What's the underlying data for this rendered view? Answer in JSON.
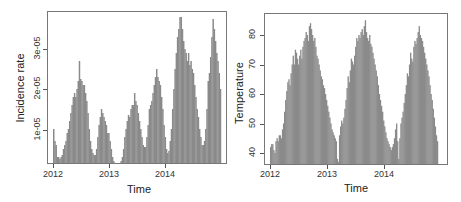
{
  "chart_data": [
    {
      "type": "bar",
      "title": "",
      "xlabel": "Time",
      "ylabel": "Incidence rate",
      "x_ticks": [
        "2012",
        "2013",
        "2014"
      ],
      "y_ticks": [
        "1e-05",
        "2e-05",
        "3e-05"
      ],
      "y_tick_values": [
        1e-05,
        2e-05,
        3e-05
      ],
      "xlim": [
        2012.0,
        2015.0
      ],
      "ylim": [
        0,
        3.8e-05
      ],
      "bar_color": "#8a8a8a",
      "grid": false,
      "legend": null,
      "x_start": 2012.0,
      "x_step_years": 0.01923,
      "unit_scale": 1e-05,
      "values_scaled": [
        1.0,
        0.7,
        0.6,
        0.3,
        0.3,
        0.25,
        0.3,
        0.35,
        0.5,
        0.6,
        0.7,
        0.9,
        1.0,
        1.2,
        1.4,
        1.6,
        1.8,
        1.9,
        1.8,
        2.0,
        2.2,
        2.7,
        2.25,
        2.2,
        2.1,
        2.1,
        1.9,
        1.7,
        1.4,
        1.0,
        0.7,
        0.5,
        0.4,
        0.35,
        0.35,
        0.5,
        0.8,
        1.1,
        1.3,
        1.5,
        1.4,
        1.3,
        1.2,
        1.1,
        0.9,
        0.9,
        0.7,
        0.5,
        0.3,
        0.2,
        0.15,
        0.12,
        0.1,
        0.1,
        0.12,
        0.2,
        0.3,
        0.5,
        0.8,
        1.0,
        1.2,
        1.35,
        1.3,
        1.5,
        1.6,
        1.6,
        1.9,
        1.7,
        1.6,
        1.4,
        1.2,
        1.0,
        0.8,
        0.6,
        0.55,
        0.55,
        0.8,
        1.1,
        1.5,
        1.6,
        1.7,
        1.9,
        2.1,
        2.3,
        2.5,
        2.3,
        2.2,
        2.1,
        1.8,
        1.5,
        1.1,
        0.8,
        0.5,
        0.4,
        0.45,
        0.7,
        1.0,
        1.5,
        2.0,
        2.5,
        2.9,
        3.3,
        3.5,
        3.8,
        3.8,
        3.5,
        3.2,
        3.0,
        2.9,
        2.7,
        2.9,
        2.6,
        2.7,
        2.5,
        2.4,
        2.1,
        1.8,
        1.5,
        1.3,
        1.0,
        0.8,
        0.6,
        0.6,
        0.7,
        1.0,
        1.5,
        2.2,
        2.4,
        2.8,
        3.3,
        3.75,
        3.5,
        3.2,
        2.9,
        2.7,
        2.4,
        2.0
      ]
    },
    {
      "type": "bar",
      "title": "",
      "xlabel": "Time",
      "ylabel": "Temperature",
      "x_ticks": [
        "2012",
        "2013",
        "2014"
      ],
      "y_ticks": [
        "40",
        "50",
        "60",
        "70",
        "80"
      ],
      "y_tick_values": [
        40,
        50,
        60,
        70,
        80
      ],
      "xlim": [
        2012.0,
        2015.0
      ],
      "ylim": [
        36,
        86
      ],
      "bar_color": "#8a8a8a",
      "grid": false,
      "legend": null,
      "x_start": 2012.0,
      "x_step_years": 0.01923,
      "values": [
        42,
        43,
        43,
        41,
        40,
        44,
        45,
        44,
        46,
        46,
        45,
        48,
        50,
        54,
        58,
        61,
        64,
        65,
        63,
        67,
        70,
        73,
        70,
        75,
        74,
        72,
        70,
        73,
        75,
        72,
        76,
        78,
        79,
        81,
        80,
        78,
        83,
        84,
        82,
        80,
        78,
        79,
        76,
        73,
        72,
        70,
        68,
        66,
        65,
        63,
        62,
        60,
        58,
        56,
        54,
        52,
        50,
        48,
        47,
        46,
        45,
        44,
        38,
        37,
        46,
        49,
        51,
        50,
        52,
        55,
        58,
        62,
        66,
        64,
        68,
        72,
        71,
        70,
        73,
        76,
        79,
        78,
        80,
        79,
        81,
        82,
        80,
        83,
        85,
        81,
        79,
        78,
        80,
        77,
        76,
        74,
        72,
        70,
        68,
        66,
        63,
        60,
        58,
        56,
        54,
        51,
        49,
        47,
        45,
        44,
        43,
        42,
        41,
        42,
        43,
        45,
        48,
        50,
        44,
        38,
        45,
        50,
        52,
        54,
        57,
        60,
        63,
        67,
        66,
        70,
        74,
        72,
        71,
        76,
        78,
        77,
        79,
        81,
        83,
        80,
        79,
        78,
        76,
        74,
        72,
        70,
        68,
        66,
        63,
        60,
        58,
        55,
        52,
        49,
        46,
        44
      ]
    }
  ],
  "panels": {
    "left": {
      "ylabel": "Incidence rate",
      "xlabel": "Time",
      "x_ticks": [
        "2012",
        "2013",
        "2014"
      ],
      "y_ticks": [
        "1e-05",
        "2e-05",
        "3e-05"
      ]
    },
    "right": {
      "ylabel": "Temperature",
      "xlabel": "Time",
      "x_ticks": [
        "2012",
        "2013",
        "2014"
      ],
      "y_ticks": [
        "40",
        "50",
        "60",
        "70",
        "80"
      ]
    }
  }
}
